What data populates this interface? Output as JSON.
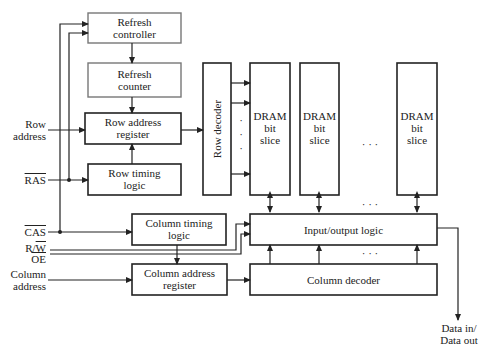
{
  "diagram": {
    "type": "block-diagram",
    "blocks": {
      "refresh_controller": "Refresh\ncontroller",
      "refresh_controller_l1": "Refresh",
      "refresh_controller_l2": "controller",
      "refresh_counter_l1": "Refresh",
      "refresh_counter_l2": "counter",
      "row_address_register_l1": "Row address",
      "row_address_register_l2": "register",
      "row_timing_logic_l1": "Row timing",
      "row_timing_logic_l2": "logic",
      "row_decoder": "Row decoder",
      "dram_slice_l1": "DRAM",
      "dram_slice_l2": "bit",
      "dram_slice_l3": "slice",
      "column_timing_logic_l1": "Column timing",
      "column_timing_logic_l2": "logic",
      "column_address_register_l1": "Column address",
      "column_address_register_l2": "register",
      "io_logic": "Input/output logic",
      "column_decoder": "Column decoder"
    },
    "signals": {
      "row_address_l1": "Row",
      "row_address_l2": "address",
      "ras": "RAS",
      "cas": "CAS",
      "rw_r": "R/",
      "rw_w": "W",
      "oe": "OE",
      "column_address_l1": "Column",
      "column_address_l2": "address",
      "data_l1": "Data in/",
      "data_l2": "Data out"
    },
    "ellipsis": "· · ·",
    "vdots": "·",
    "colors": {
      "line": "#222222",
      "gray_border": "#777777"
    }
  }
}
